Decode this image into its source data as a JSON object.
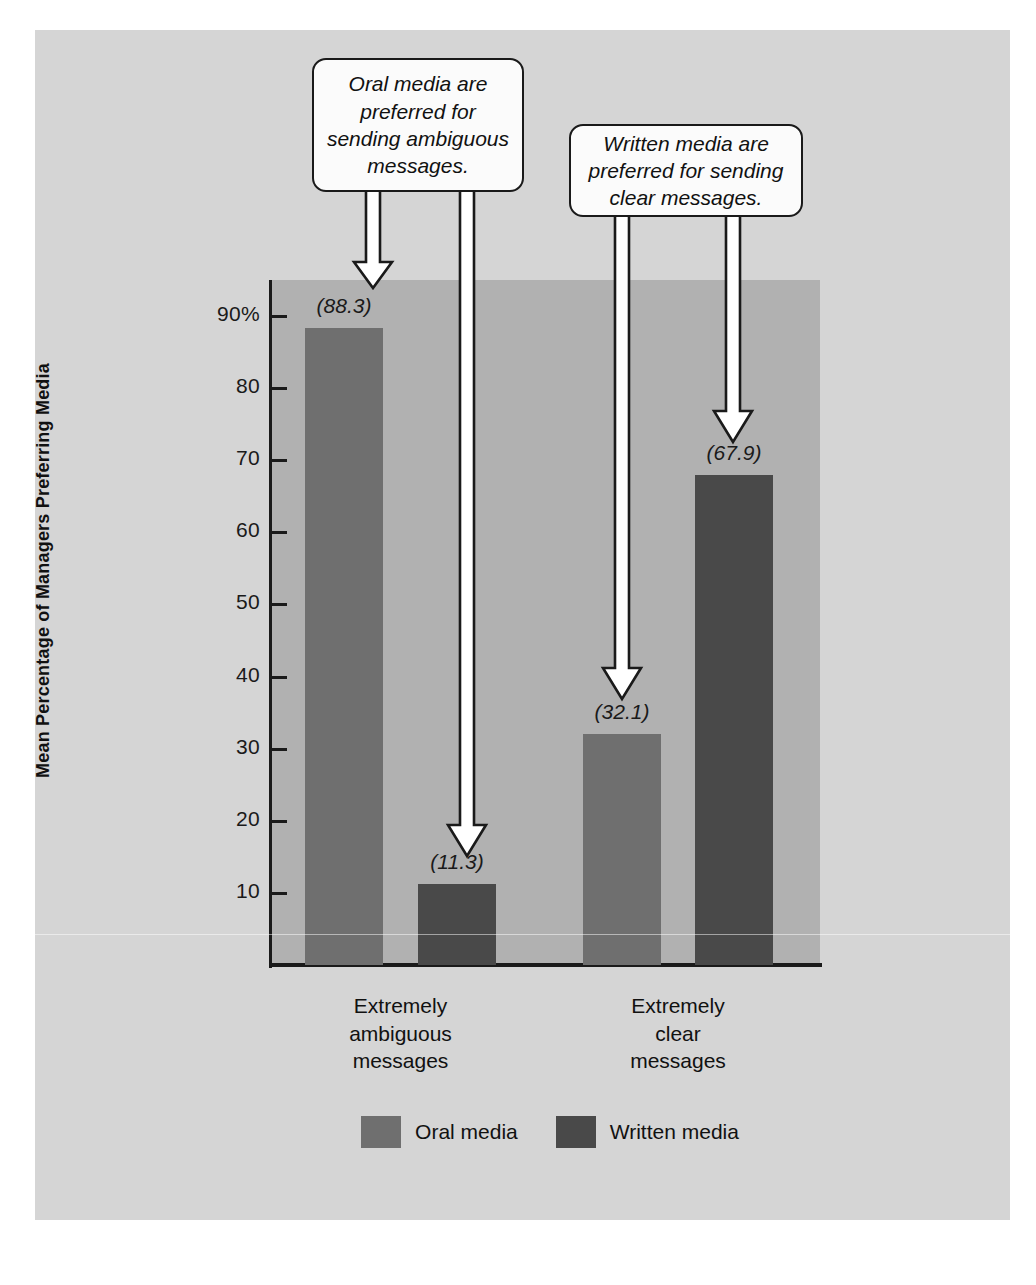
{
  "chart_data": {
    "type": "bar",
    "title": "",
    "xlabel": "",
    "ylabel": "Mean Percentage of Managers Preferring Media",
    "ylim": [
      0,
      94
    ],
    "grid": false,
    "legend_position": "bottom",
    "categories": [
      "Extremely ambiguous messages",
      "Extremely clear messages"
    ],
    "category_lines": [
      [
        "Extremely",
        "ambiguous",
        "messages"
      ],
      [
        "Extremely",
        "clear",
        "messages"
      ]
    ],
    "series": [
      {
        "name": "Oral media",
        "color": "#6f6f6f",
        "values": [
          88.3,
          32.1
        ],
        "labels": [
          "(88.3)",
          "(32.1)"
        ]
      },
      {
        "name": "Written media",
        "color": "#494949",
        "values": [
          11.3,
          67.9
        ],
        "labels": [
          "(11.3)",
          "(67.9)"
        ]
      }
    ],
    "yticks": [
      {
        "value": 90,
        "label": "90%"
      },
      {
        "value": 80,
        "label": "80"
      },
      {
        "value": 70,
        "label": "70"
      },
      {
        "value": 60,
        "label": "60"
      },
      {
        "value": 50,
        "label": "50"
      },
      {
        "value": 40,
        "label": "40"
      },
      {
        "value": 30,
        "label": "30"
      },
      {
        "value": 20,
        "label": "20"
      },
      {
        "value": 10,
        "label": "10"
      }
    ],
    "annotations": [
      {
        "text": "Oral media are preferred for sending ambiguous messages.",
        "points_to": [
          "Oral media / Extremely ambiguous messages",
          "Written media / Extremely ambiguous messages"
        ]
      },
      {
        "text": "Written media are preferred for sending clear messages.",
        "points_to": [
          "Oral media / Extremely clear messages",
          "Written media / Extremely clear messages"
        ]
      }
    ]
  },
  "callouts": [
    {
      "id": "callout-oral",
      "text": "Oral media are preferred for sending ambiguous messages."
    },
    {
      "id": "callout-written",
      "text": "Written media are preferred for sending clear messages."
    }
  ],
  "legend": {
    "items": [
      {
        "label": "Oral media",
        "color": "#6f6f6f"
      },
      {
        "label": "Written media",
        "color": "#494949"
      }
    ]
  },
  "colors": {
    "page_background": "#ffffff",
    "card_background": "#d5d5d5",
    "plot_background": "#b1b1b1",
    "axis": "#1a1a1a",
    "series_oral": "#6f6f6f",
    "series_written": "#494949",
    "callout_background": "#fbfbfb",
    "callout_border": "#1a1a1a",
    "arrow_fill": "#ffffff",
    "arrow_stroke": "#1a1a1a"
  }
}
